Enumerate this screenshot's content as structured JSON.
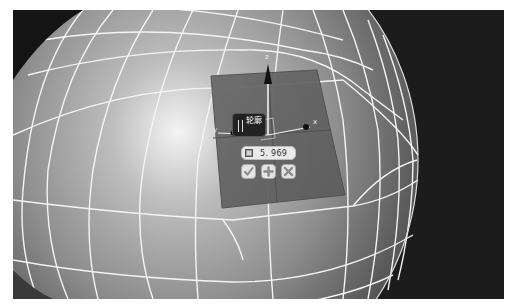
{
  "viewport": {
    "background_color": "#1c1c1c",
    "mesh": {
      "type": "sphere-wireframe",
      "surface_color": "#9a9a9a",
      "wire_color": "#f4f4f4"
    },
    "plane": {
      "color": "#6e6e6e"
    }
  },
  "gizmo": {
    "axes": {
      "z_label": "z",
      "x_label": "x",
      "y_label": "y"
    },
    "arrow_icon": "cone-arrow-icon"
  },
  "tool_popup": {
    "title_label": "轮廓",
    "grip_icon": "grip-icon",
    "value_field": {
      "icon": "unit-square-icon",
      "value": "5. 969"
    },
    "buttons": [
      {
        "name": "confirm",
        "icon": "checkmark-icon"
      },
      {
        "name": "add",
        "icon": "plus-icon"
      },
      {
        "name": "cancel",
        "icon": "x-icon"
      }
    ]
  }
}
